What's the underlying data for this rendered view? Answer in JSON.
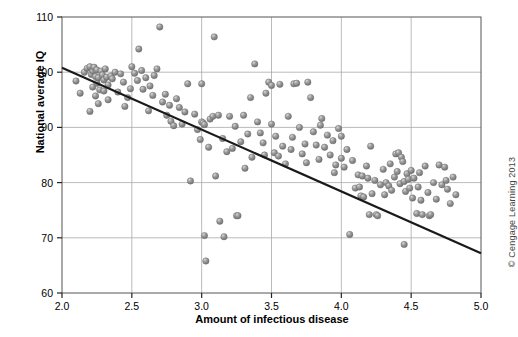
{
  "figure": {
    "background": "#ffffff",
    "credit": "© Cengage Learning 2013"
  },
  "chart_data": {
    "type": "scatter",
    "title": "",
    "xlabel": "Amount of infectious disease",
    "ylabel": "National average IQ",
    "xlim": [
      2.0,
      5.0
    ],
    "ylim": [
      60,
      110
    ],
    "xticks": [
      2.0,
      2.5,
      3.0,
      3.5,
      4.0,
      4.5,
      5.0
    ],
    "xtick_labels": [
      "2.0",
      "2.5",
      "3.0",
      "3.5",
      "4.0",
      "4.5",
      "5.0"
    ],
    "yticks": [
      60,
      70,
      80,
      90,
      100,
      110
    ],
    "ytick_labels": [
      "60",
      "70",
      "80",
      "90",
      "100",
      "110"
    ],
    "grid": true,
    "grid_color": "#aaaaaa",
    "legend": null,
    "marker": {
      "shape": "circle",
      "color": "#8a8a8a",
      "edge_color": "#6e6e6e",
      "highlight_color": "#d6d6d6",
      "size_px": 6.4
    },
    "trendline": {
      "type": "linear",
      "color": "#1a1a1a",
      "width_px": 2.2,
      "x_start": 2.0,
      "y_start": 100.8,
      "x_end": 5.0,
      "y_end": 67.2,
      "slope": -11.2,
      "intercept": 123.2
    },
    "n_points": 184,
    "points": [
      [
        2.1,
        98.4
      ],
      [
        2.13,
        96.2
      ],
      [
        2.16,
        100.0
      ],
      [
        2.18,
        100.7
      ],
      [
        2.2,
        101.0
      ],
      [
        2.21,
        99.6
      ],
      [
        2.22,
        100.2
      ],
      [
        2.22,
        97.3
      ],
      [
        2.23,
        100.9
      ],
      [
        2.24,
        99.2
      ],
      [
        2.25,
        98.0
      ],
      [
        2.25,
        100.4
      ],
      [
        2.26,
        99.0
      ],
      [
        2.27,
        96.8
      ],
      [
        2.28,
        100.2
      ],
      [
        2.29,
        99.5
      ],
      [
        2.3,
        98.6
      ],
      [
        2.31,
        100.6
      ],
      [
        2.32,
        99.1
      ],
      [
        2.33,
        97.7
      ],
      [
        2.2,
        92.9
      ],
      [
        2.24,
        95.7
      ],
      [
        2.26,
        94.3
      ],
      [
        2.3,
        96.6
      ],
      [
        2.33,
        95.0
      ],
      [
        2.35,
        99.3
      ],
      [
        2.36,
        98.8
      ],
      [
        2.38,
        100.0
      ],
      [
        2.4,
        96.4
      ],
      [
        2.42,
        99.7
      ],
      [
        2.44,
        98.2
      ],
      [
        2.45,
        93.8
      ],
      [
        2.47,
        95.4
      ],
      [
        2.49,
        97.0
      ],
      [
        2.5,
        101.0
      ],
      [
        2.52,
        99.8
      ],
      [
        2.54,
        98.5
      ],
      [
        2.55,
        104.2
      ],
      [
        2.57,
        100.3
      ],
      [
        2.58,
        96.9
      ],
      [
        2.6,
        99.0
      ],
      [
        2.62,
        93.0
      ],
      [
        2.63,
        97.5
      ],
      [
        2.65,
        95.8
      ],
      [
        2.66,
        99.4
      ],
      [
        2.68,
        100.6
      ],
      [
        2.7,
        108.2
      ],
      [
        2.72,
        94.6
      ],
      [
        2.74,
        96.0
      ],
      [
        2.75,
        92.2
      ],
      [
        2.77,
        94.0
      ],
      [
        2.78,
        91.1
      ],
      [
        2.8,
        90.3
      ],
      [
        2.82,
        95.2
      ],
      [
        2.84,
        93.6
      ],
      [
        2.86,
        90.6
      ],
      [
        2.88,
        92.8
      ],
      [
        2.9,
        97.9
      ],
      [
        2.92,
        80.3
      ],
      [
        2.95,
        92.4
      ],
      [
        2.97,
        89.6
      ],
      [
        2.99,
        87.8
      ],
      [
        3.0,
        97.9
      ],
      [
        3.0,
        91.0
      ],
      [
        3.01,
        90.8
      ],
      [
        3.02,
        90.5
      ],
      [
        3.02,
        70.4
      ],
      [
        3.03,
        65.8
      ],
      [
        3.05,
        86.4
      ],
      [
        3.06,
        91.5
      ],
      [
        3.08,
        92.0
      ],
      [
        3.09,
        106.4
      ],
      [
        3.1,
        81.2
      ],
      [
        3.12,
        92.2
      ],
      [
        3.13,
        73.0
      ],
      [
        3.15,
        88.0
      ],
      [
        3.16,
        70.2
      ],
      [
        3.18,
        85.6
      ],
      [
        3.2,
        92.0
      ],
      [
        3.22,
        86.2
      ],
      [
        3.24,
        90.2
      ],
      [
        3.25,
        74.0
      ],
      [
        3.26,
        74.0
      ],
      [
        3.28,
        87.4
      ],
      [
        3.3,
        92.2
      ],
      [
        3.31,
        82.6
      ],
      [
        3.33,
        88.8
      ],
      [
        3.35,
        95.4
      ],
      [
        3.36,
        84.6
      ],
      [
        3.38,
        101.5
      ],
      [
        3.4,
        91.0
      ],
      [
        3.42,
        89.0
      ],
      [
        3.44,
        87.2
      ],
      [
        3.45,
        85.0
      ],
      [
        3.46,
        96.2
      ],
      [
        3.48,
        98.2
      ],
      [
        3.5,
        97.6
      ],
      [
        3.5,
        90.6
      ],
      [
        3.52,
        85.4
      ],
      [
        3.53,
        88.4
      ],
      [
        3.55,
        84.8
      ],
      [
        3.56,
        97.8
      ],
      [
        3.58,
        86.6
      ],
      [
        3.6,
        83.4
      ],
      [
        3.62,
        92.0
      ],
      [
        3.64,
        86.0
      ],
      [
        3.65,
        88.2
      ],
      [
        3.66,
        97.9
      ],
      [
        3.68,
        98.0
      ],
      [
        3.7,
        90.0
      ],
      [
        3.72,
        85.2
      ],
      [
        3.74,
        87.0
      ],
      [
        3.75,
        83.6
      ],
      [
        3.76,
        98.2
      ],
      [
        3.78,
        95.4
      ],
      [
        3.8,
        89.2
      ],
      [
        3.82,
        86.8
      ],
      [
        3.84,
        84.2
      ],
      [
        3.85,
        90.4
      ],
      [
        3.86,
        91.6
      ],
      [
        3.88,
        86.4
      ],
      [
        3.9,
        88.6
      ],
      [
        3.92,
        85.0
      ],
      [
        3.94,
        87.6
      ],
      [
        3.95,
        81.8
      ],
      [
        3.96,
        83.2
      ],
      [
        3.98,
        89.8
      ],
      [
        4.0,
        84.4
      ],
      [
        4.0,
        88.4
      ],
      [
        4.02,
        82.8
      ],
      [
        4.04,
        86.0
      ],
      [
        4.06,
        70.6
      ],
      [
        4.08,
        84.0
      ],
      [
        4.1,
        79.0
      ],
      [
        4.12,
        81.4
      ],
      [
        4.13,
        79.2
      ],
      [
        4.14,
        77.6
      ],
      [
        4.15,
        81.2
      ],
      [
        4.16,
        77.4
      ],
      [
        4.18,
        83.0
      ],
      [
        4.19,
        80.8
      ],
      [
        4.2,
        74.2
      ],
      [
        4.21,
        86.6
      ],
      [
        4.22,
        78.0
      ],
      [
        4.24,
        80.4
      ],
      [
        4.25,
        74.2
      ],
      [
        4.26,
        74.0
      ],
      [
        4.28,
        79.6
      ],
      [
        4.3,
        82.4
      ],
      [
        4.31,
        77.8
      ],
      [
        4.32,
        80.0
      ],
      [
        4.34,
        79.4
      ],
      [
        4.35,
        83.4
      ],
      [
        4.36,
        78.6
      ],
      [
        4.38,
        81.0
      ],
      [
        4.39,
        85.2
      ],
      [
        4.4,
        82.0
      ],
      [
        4.41,
        85.4
      ],
      [
        4.42,
        79.8
      ],
      [
        4.43,
        84.6
      ],
      [
        4.44,
        83.8
      ],
      [
        4.45,
        80.2
      ],
      [
        4.45,
        68.8
      ],
      [
        4.46,
        78.4
      ],
      [
        4.47,
        81.6
      ],
      [
        4.48,
        80.6
      ],
      [
        4.49,
        79.0
      ],
      [
        4.5,
        82.2
      ],
      [
        4.51,
        77.2
      ],
      [
        4.52,
        80.8
      ],
      [
        4.54,
        74.4
      ],
      [
        4.55,
        79.2
      ],
      [
        4.56,
        81.8
      ],
      [
        4.57,
        76.8
      ],
      [
        4.58,
        74.2
      ],
      [
        4.6,
        83.0
      ],
      [
        4.62,
        78.2
      ],
      [
        4.63,
        74.0
      ],
      [
        4.64,
        74.2
      ],
      [
        4.66,
        80.0
      ],
      [
        4.68,
        77.0
      ],
      [
        4.7,
        83.2
      ],
      [
        4.72,
        79.6
      ],
      [
        4.74,
        82.8
      ],
      [
        4.75,
        80.4
      ],
      [
        4.76,
        78.8
      ],
      [
        4.78,
        76.2
      ],
      [
        4.8,
        81.0
      ],
      [
        4.82,
        77.8
      ]
    ]
  },
  "axis": {
    "y_title": "National average IQ",
    "x_title": "Amount of infectious disease"
  }
}
